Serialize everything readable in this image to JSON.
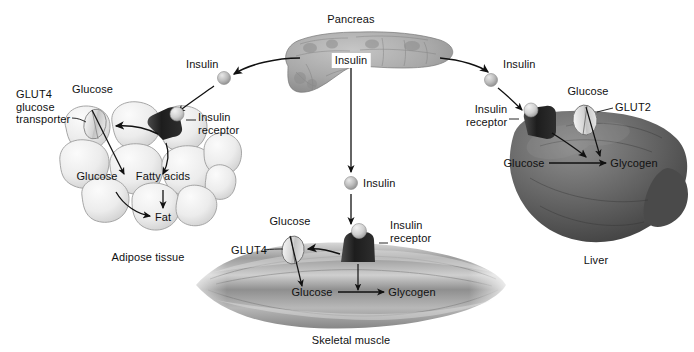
{
  "diagram": {
    "background": "#ffffff",
    "ink": "#111111"
  },
  "organs": {
    "pancreas": {
      "label": "Pancreas",
      "fill": "#9a9a9a"
    },
    "liver": {
      "label": "Liver",
      "fill": "#555555"
    },
    "adipose": {
      "label": "Adipose tissue",
      "fill": "#ededed"
    },
    "muscle": {
      "label": "Skeletal muscle",
      "fill": "#8d8d8d"
    }
  },
  "hormone": {
    "source_label": "Insulin",
    "left_label": "Insulin",
    "center_label": "Insulin",
    "right_label": "Insulin",
    "particle_color": "#b6b6b6"
  },
  "adipose_panel": {
    "transporter_label": "GLUT4\nglucose\ntransporter",
    "glucose_top_label": "Glucose",
    "receptor_label": "Insulin\nreceptor",
    "glucose_label": "Glucose",
    "fatty_acids_label": "Fatty acids",
    "fat_label": "Fat",
    "tissue_label": "Adipose tissue"
  },
  "muscle_panel": {
    "glucose_top_label": "Glucose",
    "transporter_label": "GLUT4",
    "receptor_label": "Insulin\nreceptor",
    "glucose_label": "Glucose",
    "glycogen_label": "Glycogen",
    "tissue_label": "Skeletal muscle"
  },
  "liver_panel": {
    "receptor_label": "Insulin\nreceptor",
    "glucose_top_label": "Glucose",
    "transporter_label": "GLUT2",
    "glucose_label": "Glucose",
    "glycogen_label": "Glycogen",
    "tissue_label": "Liver"
  }
}
